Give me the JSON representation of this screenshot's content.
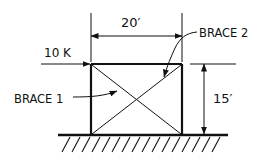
{
  "diagram": {
    "type": "braced frame",
    "labels": {
      "load": "10 K",
      "width_dim": "20′",
      "height_dim": "15′",
      "brace1": "BRACE 1",
      "brace2": "BRACE 2"
    },
    "colors": {
      "ink": "#111111",
      "background": "#ffffff"
    }
  }
}
